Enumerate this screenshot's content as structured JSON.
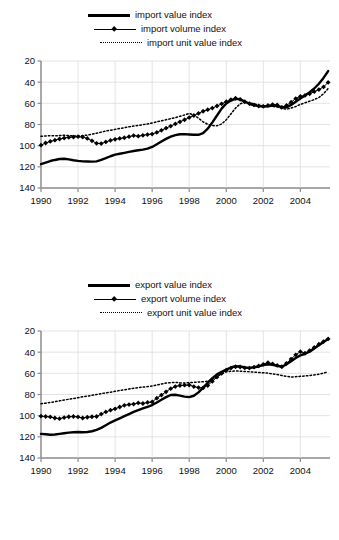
{
  "document": {
    "clipped_heading_text": "                                                                "
  },
  "charts": [
    {
      "id": "import",
      "legend": [
        {
          "label": "import value index",
          "style": "solid-thick"
        },
        {
          "label": "import volume index",
          "style": "marker"
        },
        {
          "label": "import unit value index",
          "style": "dotted"
        }
      ],
      "axes": {
        "y_ticks": [
          "140",
          "120",
          "100",
          "80",
          "60",
          "40",
          "20"
        ],
        "x_ticks": [
          "1990",
          "1992",
          "1994",
          "1996",
          "1998",
          "2000",
          "2002",
          "2004"
        ]
      },
      "chart_data": {
        "type": "line",
        "title": "Import value, volume and unit value indices",
        "xlabel": "",
        "ylabel": "",
        "xlim": [
          1990.0,
          2005.6
        ],
        "ylim": [
          20,
          140
        ],
        "grid": true,
        "legend_position": "top",
        "x_ticks": [
          1990,
          1992,
          1994,
          1996,
          1998,
          2000,
          2002,
          2004
        ],
        "y_ticks": [
          20,
          40,
          60,
          80,
          100,
          120,
          140
        ],
        "x": [
          1990.0,
          1990.25,
          1990.5,
          1990.75,
          1991.0,
          1991.25,
          1991.5,
          1991.75,
          1992.0,
          1992.25,
          1992.5,
          1992.75,
          1993.0,
          1993.25,
          1993.5,
          1993.75,
          1994.0,
          1994.25,
          1994.5,
          1994.75,
          1995.0,
          1995.25,
          1995.5,
          1995.75,
          1996.0,
          1996.25,
          1996.5,
          1996.75,
          1997.0,
          1997.25,
          1997.5,
          1997.75,
          1998.0,
          1998.25,
          1998.5,
          1998.75,
          1999.0,
          1999.25,
          1999.5,
          1999.75,
          2000.0,
          2000.25,
          2000.5,
          2000.75,
          2001.0,
          2001.25,
          2001.5,
          2001.75,
          2002.0,
          2002.25,
          2002.5,
          2002.75,
          2003.0,
          2003.25,
          2003.5,
          2003.75,
          2004.0,
          2004.25,
          2004.5,
          2004.75,
          2005.0,
          2005.25,
          2005.5
        ],
        "series": [
          {
            "name": "import value index",
            "style": "solid-thick",
            "values": [
              42.5,
              44.0,
              45.5,
              46.5,
              47.4,
              47.6,
              47.0,
              46.2,
              45.6,
              45.2,
              45.0,
              44.9,
              45.2,
              46.5,
              48.2,
              50.0,
              51.5,
              52.4,
              53.2,
              54.1,
              55.0,
              55.7,
              56.3,
              57.2,
              58.8,
              61.3,
              64.0,
              66.4,
              68.5,
              70.0,
              70.8,
              70.9,
              70.6,
              70.3,
              70.3,
              71.8,
              76.0,
              82.0,
              88.5,
              95.0,
              99.8,
              102.6,
              104.2,
              103.8,
              101.6,
              99.6,
              98.2,
              97.4,
              96.9,
              97.2,
              97.8,
              97.6,
              96.5,
              96.2,
              98.5,
              101.5,
              104.5,
              107.5,
              110.5,
              114.0,
              118.5,
              124.0,
              130.5
            ]
          },
          {
            "name": "import volume index",
            "style": "marker",
            "values": [
              60.5,
              62.5,
              64.0,
              65.2,
              66.3,
              67.2,
              67.8,
              68.2,
              68.5,
              68.2,
              66.8,
              64.6,
              62.2,
              62.0,
              63.5,
              65.0,
              66.0,
              66.8,
              67.5,
              68.5,
              69.5,
              69.0,
              69.8,
              70.5,
              71.0,
              72.5,
              74.5,
              76.5,
              78.5,
              80.5,
              82.5,
              84.5,
              86.5,
              88.5,
              90.5,
              92.5,
              94.0,
              95.5,
              97.5,
              99.5,
              101.5,
              103.5,
              104.8,
              103.8,
              101.5,
              99.8,
              98.5,
              97.5,
              97.2,
              98.0,
              98.8,
              98.5,
              96.2,
              98.0,
              101.0,
              104.5,
              106.5,
              107.5,
              109.0,
              111.0,
              113.0,
              115.5,
              119.8
            ]
          },
          {
            "name": "import unit value index",
            "style": "dotted",
            "values": [
              68.8,
              69.2,
              69.4,
              69.3,
              69.5,
              69.8,
              69.5,
              69.2,
              69.0,
              69.4,
              70.0,
              70.8,
              71.8,
              72.8,
              73.8,
              74.6,
              75.4,
              76.2,
              77.0,
              77.8,
              78.5,
              79.2,
              79.8,
              80.5,
              81.5,
              82.5,
              83.5,
              84.5,
              85.5,
              86.5,
              87.8,
              89.0,
              90.5,
              89.0,
              86.0,
              82.5,
              80.2,
              79.0,
              78.8,
              80.5,
              84.5,
              90.0,
              95.5,
              99.5,
              101.0,
              100.5,
              99.5,
              98.5,
              97.8,
              97.5,
              97.2,
              96.5,
              95.2,
              94.5,
              95.5,
              97.0,
              99.0,
              100.5,
              102.0,
              103.5,
              105.5,
              109.0,
              114.0
            ]
          }
        ]
      }
    },
    {
      "id": "export",
      "legend": [
        {
          "label": "export value index",
          "style": "solid-thick"
        },
        {
          "label": "export volume index",
          "style": "marker"
        },
        {
          "label": "export unit value index",
          "style": "dotted"
        }
      ],
      "axes": {
        "y_ticks": [
          "140",
          "120",
          "100",
          "80",
          "60",
          "40",
          "20"
        ],
        "x_ticks": [
          "1990",
          "1992",
          "1994",
          "1996",
          "1998",
          "2000",
          "2002",
          "2004"
        ]
      },
      "chart_data": {
        "type": "line",
        "title": "Export value, volume and unit value indices",
        "xlabel": "",
        "ylabel": "",
        "xlim": [
          1990.0,
          2005.6
        ],
        "ylim": [
          20,
          140
        ],
        "grid": true,
        "legend_position": "top",
        "x_ticks": [
          1990,
          1992,
          1994,
          1996,
          1998,
          2000,
          2002,
          2004
        ],
        "y_ticks": [
          20,
          40,
          60,
          80,
          100,
          120,
          140
        ],
        "x": [
          1990.0,
          1990.25,
          1990.5,
          1990.75,
          1991.0,
          1991.25,
          1991.5,
          1991.75,
          1992.0,
          1992.25,
          1992.5,
          1992.75,
          1993.0,
          1993.25,
          1993.5,
          1993.75,
          1994.0,
          1994.25,
          1994.5,
          1994.75,
          1995.0,
          1995.25,
          1995.5,
          1995.75,
          1996.0,
          1996.25,
          1996.5,
          1996.75,
          1997.0,
          1997.25,
          1997.5,
          1997.75,
          1998.0,
          1998.25,
          1998.5,
          1998.75,
          1999.0,
          1999.25,
          1999.5,
          1999.75,
          2000.0,
          2000.25,
          2000.5,
          2000.75,
          2001.0,
          2001.25,
          2001.5,
          2001.75,
          2002.0,
          2002.25,
          2002.5,
          2002.75,
          2003.0,
          2003.25,
          2003.5,
          2003.75,
          2004.0,
          2004.25,
          2004.5,
          2004.75,
          2005.0,
          2005.25,
          2005.5
        ],
        "series": [
          {
            "name": "export value index",
            "style": "solid-thick",
            "values": [
              42.8,
              42.4,
              42.0,
              42.2,
              42.8,
              43.4,
              44.0,
              44.3,
              44.5,
              44.4,
              44.6,
              45.3,
              46.5,
              48.5,
              51.0,
              53.5,
              55.5,
              57.5,
              59.5,
              61.5,
              63.5,
              65.2,
              66.8,
              68.4,
              70.0,
              72.5,
              75.0,
              77.5,
              79.5,
              79.8,
              79.0,
              78.0,
              77.5,
              78.8,
              82.0,
              86.5,
              91.0,
              95.5,
              99.0,
              101.5,
              103.5,
              105.5,
              106.8,
              106.5,
              105.5,
              105.2,
              105.8,
              106.5,
              107.8,
              108.5,
              108.0,
              107.2,
              106.2,
              108.5,
              111.5,
              114.5,
              117.0,
              118.5,
              120.5,
              123.5,
              126.5,
              129.5,
              132.5
            ]
          },
          {
            "name": "export volume index",
            "style": "marker",
            "values": [
              59.5,
              59.2,
              58.8,
              57.8,
              57.2,
              58.2,
              59.0,
              59.2,
              58.8,
              57.8,
              58.5,
              59.0,
              59.2,
              61.5,
              63.5,
              65.2,
              66.5,
              68.2,
              69.8,
              70.5,
              71.0,
              72.0,
              71.5,
              72.5,
              73.0,
              76.5,
              79.5,
              82.5,
              85.5,
              87.5,
              88.5,
              88.8,
              89.0,
              87.5,
              86.5,
              86.2,
              88.5,
              92.5,
              96.5,
              100.0,
              103.0,
              105.0,
              106.2,
              106.0,
              105.2,
              105.0,
              105.8,
              107.0,
              108.5,
              110.0,
              109.0,
              107.5,
              106.2,
              109.5,
              113.5,
              117.5,
              120.5,
              119.0,
              121.5,
              124.5,
              127.5,
              130.0,
              132.5
            ]
          },
          {
            "name": "export unit value index",
            "style": "dotted",
            "values": [
              71.2,
              71.8,
              72.5,
              73.2,
              74.0,
              74.8,
              75.5,
              76.2,
              77.0,
              77.8,
              78.5,
              79.2,
              80.0,
              80.8,
              81.5,
              82.2,
              83.0,
              83.8,
              84.5,
              85.2,
              86.0,
              86.5,
              87.0,
              87.5,
              88.0,
              89.0,
              90.0,
              90.8,
              91.2,
              91.5,
              91.0,
              90.8,
              91.2,
              91.5,
              91.8,
              92.0,
              92.5,
              94.5,
              97.0,
              99.5,
              101.5,
              102.0,
              102.2,
              102.0,
              101.8,
              101.5,
              101.2,
              100.8,
              100.5,
              100.2,
              99.5,
              98.8,
              98.0,
              97.2,
              96.5,
              96.8,
              97.2,
              97.5,
              98.0,
              98.5,
              99.2,
              100.2,
              101.5
            ]
          }
        ]
      }
    }
  ]
}
